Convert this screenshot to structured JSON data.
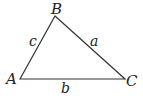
{
  "diagram": {
    "type": "triangle",
    "vertices": [
      {
        "id": "A",
        "label": "A",
        "x": 20,
        "y": 79
      },
      {
        "id": "B",
        "label": "B",
        "x": 55,
        "y": 16
      },
      {
        "id": "C",
        "label": "C",
        "x": 125,
        "y": 79
      }
    ],
    "sides": [
      {
        "id": "a",
        "label": "a",
        "from": "B",
        "to": "C"
      },
      {
        "id": "b",
        "label": "b",
        "from": "A",
        "to": "C"
      },
      {
        "id": "c",
        "label": "c",
        "from": "A",
        "to": "B"
      }
    ],
    "stroke_color": "#333333"
  }
}
